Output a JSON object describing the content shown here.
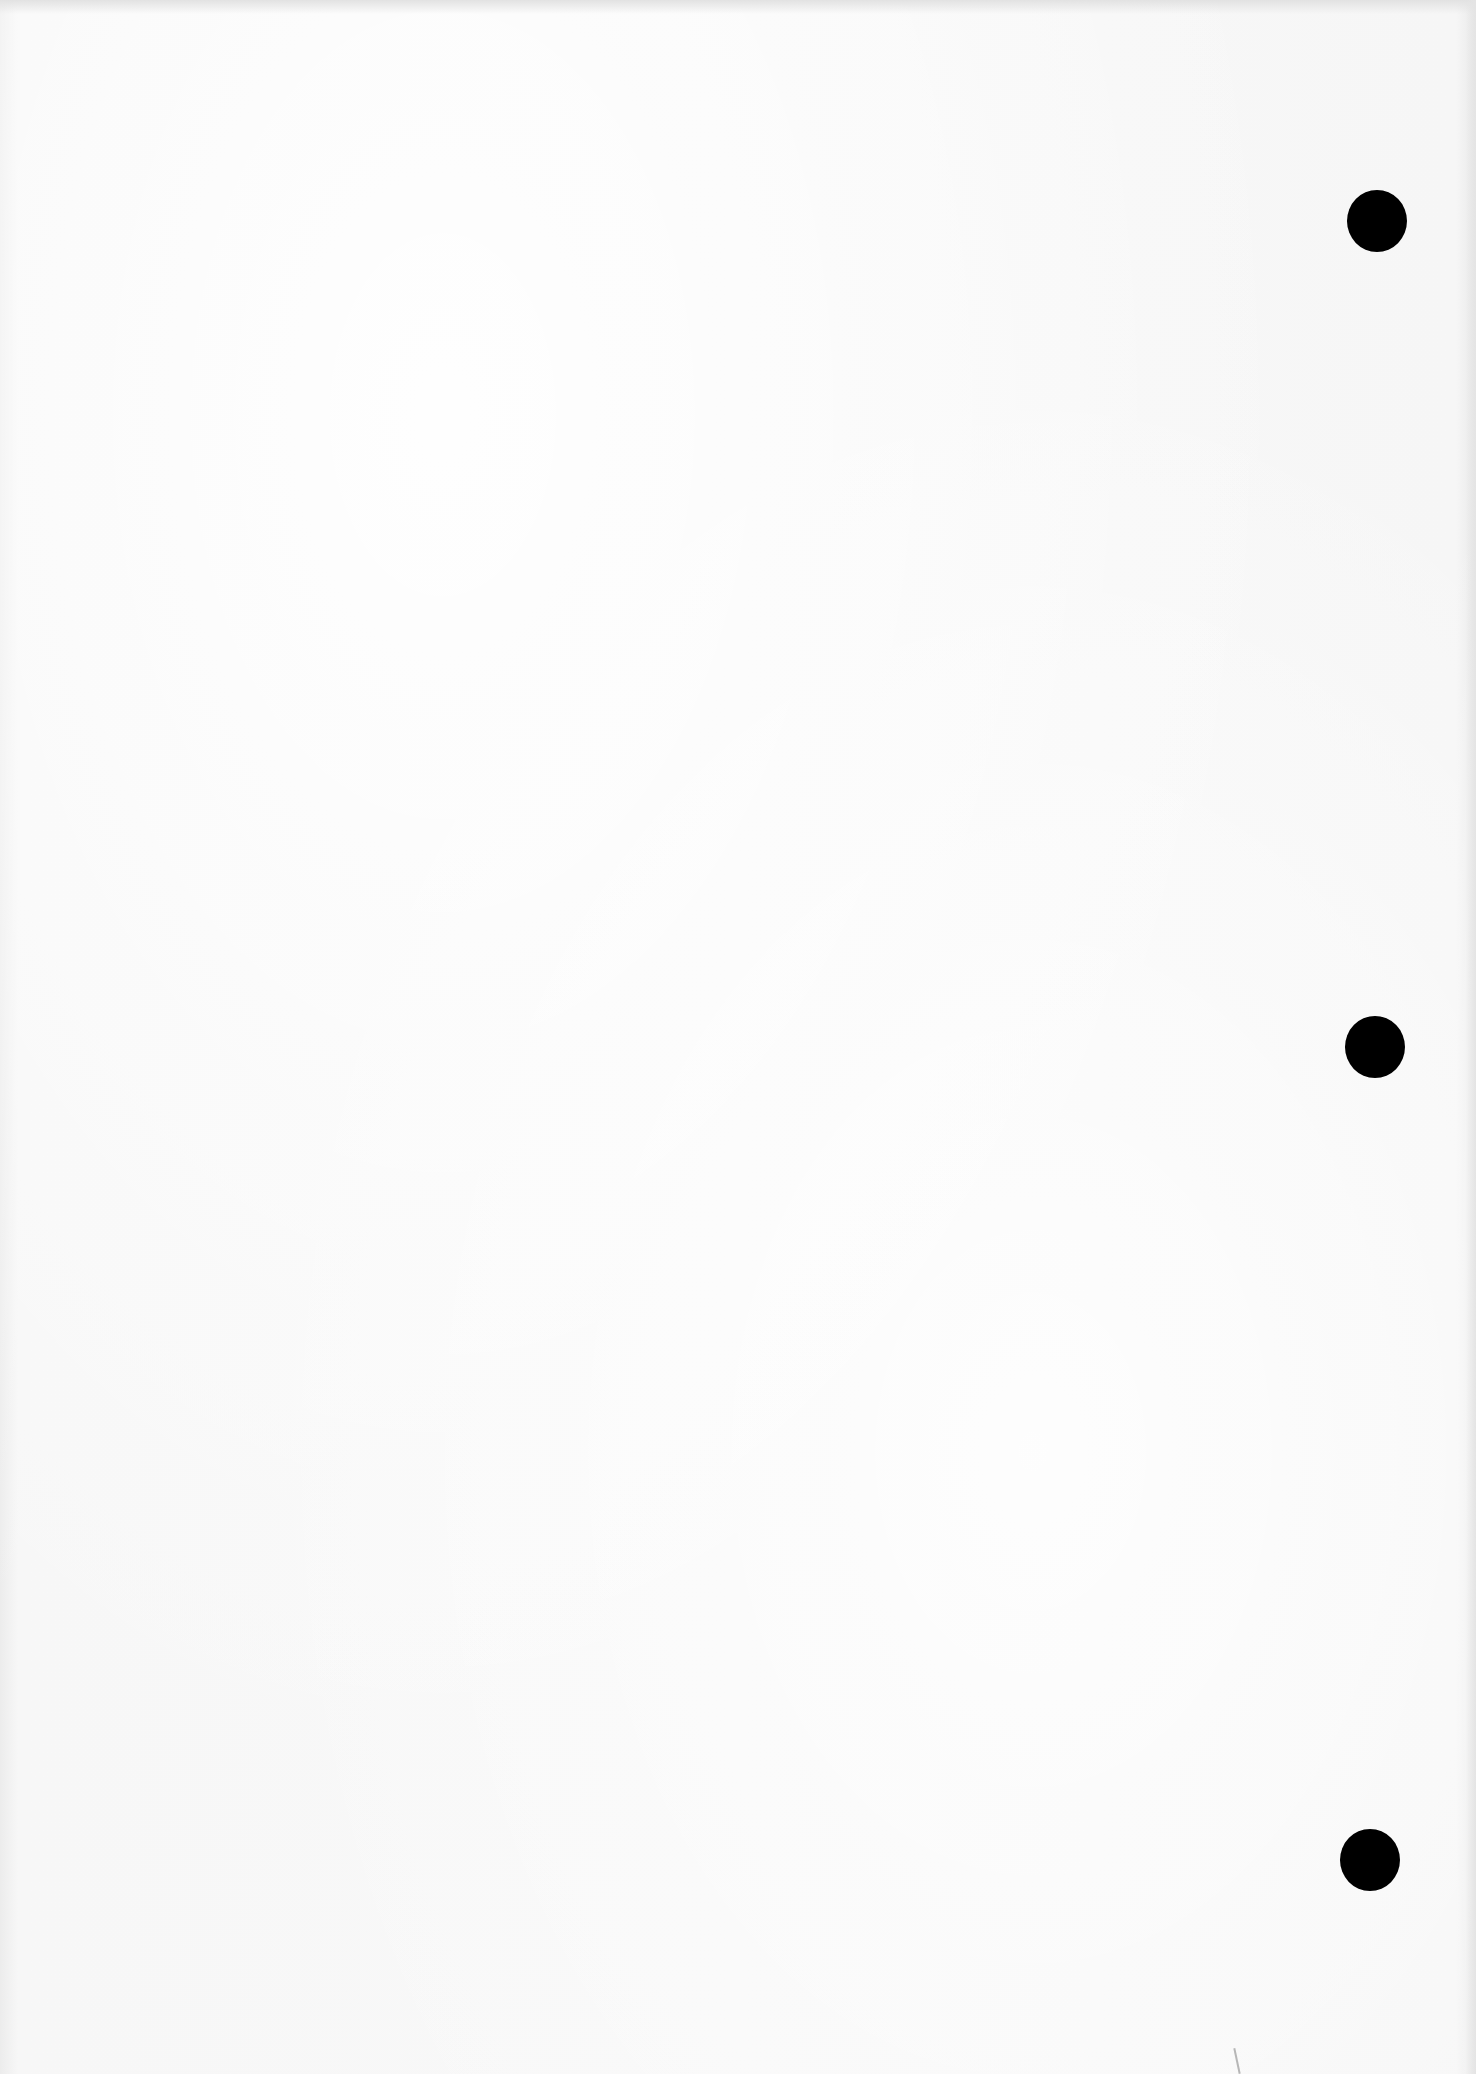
{
  "page": {
    "type": "blank-scanned-sheet",
    "paper_color": "#f6f6f6",
    "content_text": ""
  },
  "punch_holes": [
    {
      "cx": 1377,
      "cy": 221,
      "rx": 30,
      "ry": 31,
      "color": "#000000"
    },
    {
      "cx": 1375,
      "cy": 1047,
      "rx": 30,
      "ry": 31,
      "color": "#000000"
    },
    {
      "cx": 1370,
      "cy": 1860,
      "rx": 30,
      "ry": 31,
      "color": "#000000"
    }
  ]
}
